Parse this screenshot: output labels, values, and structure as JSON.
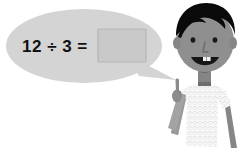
{
  "scene": {
    "title": "Division problem illustration",
    "background_color": "#ffffff",
    "width": 246,
    "height": 158
  },
  "speech_bubble": {
    "name": "speech-bubble",
    "fill_color": "#d4d4d4",
    "tail_description": "pointer toward character",
    "equation": {
      "operand_left": "12",
      "operator": "÷",
      "operand_right": "3",
      "equals": "=",
      "full_text": "12 ÷ 3 =",
      "text_color": "#111111"
    },
    "answer_box": {
      "value": "",
      "placeholder": "",
      "fill_color": "#c9c9c9",
      "border_color": "#b4b4b4"
    }
  },
  "character": {
    "name": "student-character",
    "description": "boy pointing upward with index finger",
    "hair_color": "#0a0a0a",
    "skin_color": "#8f8f8f",
    "skin_shadow_color": "#7c7c7c",
    "mouth_color": "#161616",
    "tooth_color": "#f2f2f2",
    "eye_color": "#1a1a1a",
    "shirt_color": "#f7f7f7",
    "shirt_pattern_color": "#d9d9d9",
    "collar_color": "#6e6e6e"
  }
}
